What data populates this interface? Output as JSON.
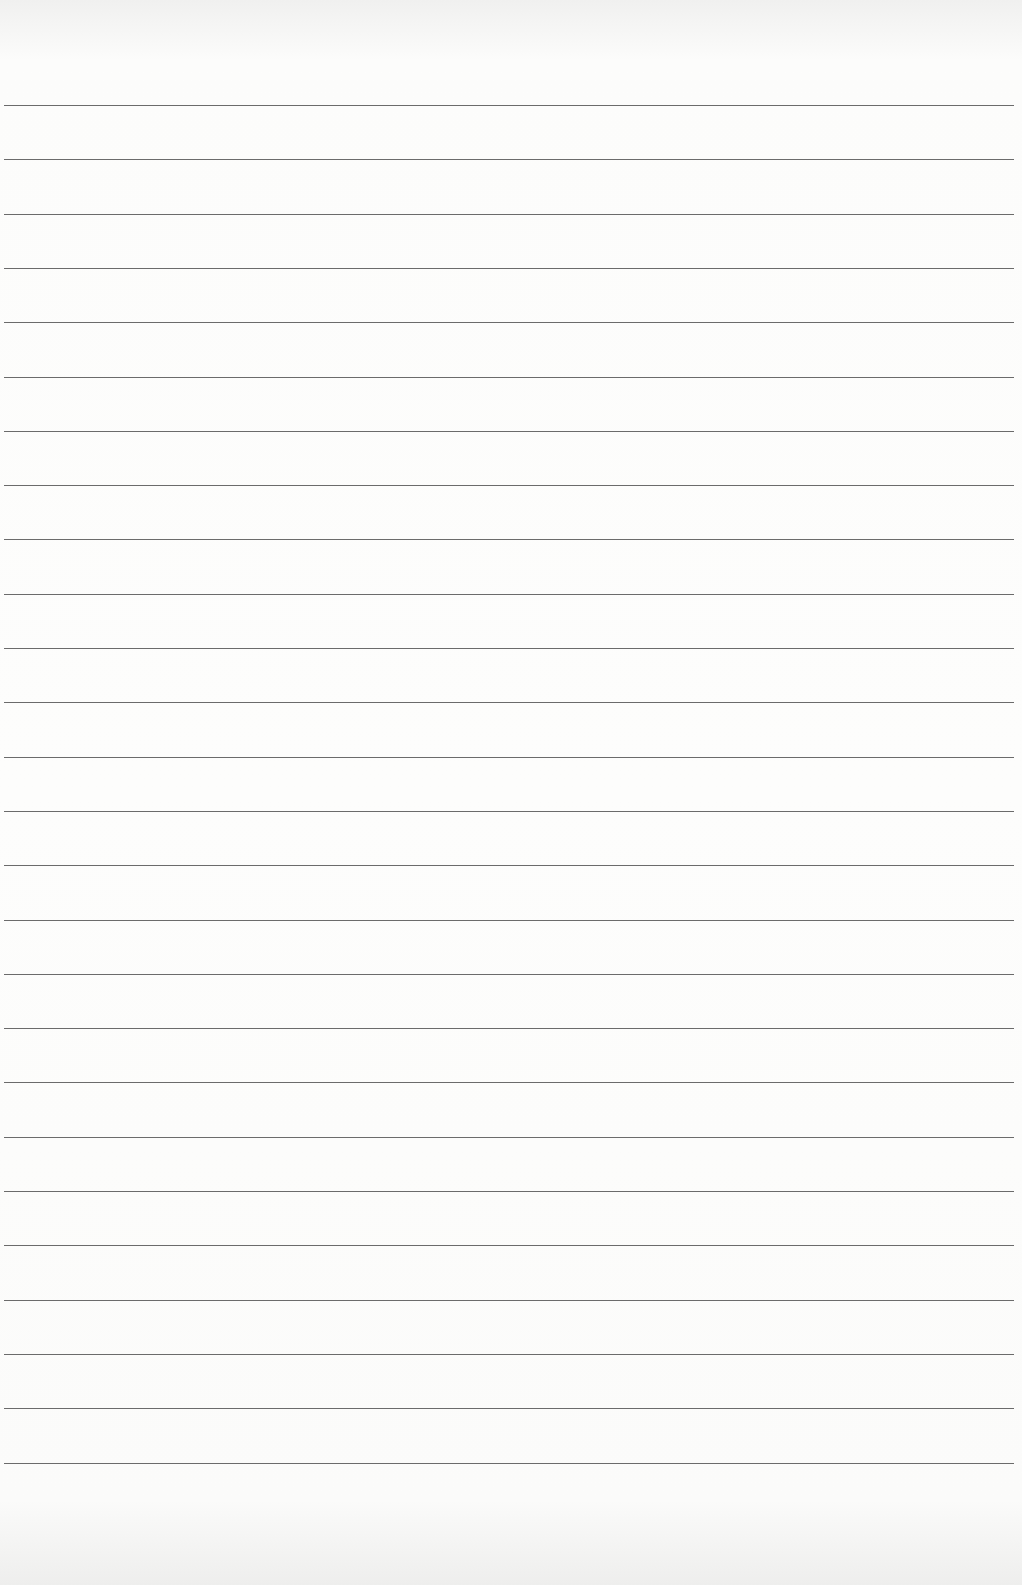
{
  "page": {
    "type": "lined-paper",
    "background_color": "#fdfdfc",
    "line_color": "#6b6b6b",
    "line_count": 26,
    "first_line_y": 105,
    "line_spacing": 54.3,
    "text": []
  }
}
